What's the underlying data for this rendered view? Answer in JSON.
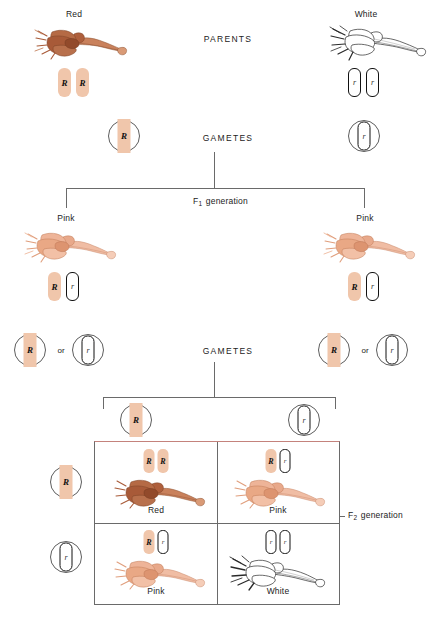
{
  "diagram": {
    "colors": {
      "dominant_allele_block": "#f0c6ab",
      "recessive_allele_block": "#ffffff",
      "line": "#6a6a6a",
      "red_flower": "#b5643f",
      "pink_flower": "#e2a184",
      "white_flower": "#ffffff",
      "punnett_top_border": "#c4827c"
    }
  },
  "stage_labels": {
    "parents": "PARENTS",
    "gametes_1": "GAMETES",
    "gametes_2": "GAMETES",
    "f1_generation_prefix": "F",
    "f1_generation_sub": "1",
    "f1_generation_suffix": " generation",
    "f2_generation_prefix": "F",
    "f2_generation_sub": "2",
    "f2_generation_suffix": " generation"
  },
  "parents": {
    "left": {
      "phenotype": "Red",
      "alleles": [
        "R",
        "R"
      ],
      "allele_types": [
        "dominant",
        "dominant"
      ],
      "flower_color": "red"
    },
    "right": {
      "phenotype": "White",
      "alleles": [
        "r",
        "r"
      ],
      "allele_types": [
        "recessive",
        "recessive"
      ],
      "flower_color": "white"
    }
  },
  "parent_gametes": {
    "left": {
      "allele": "R",
      "type": "dominant"
    },
    "right": {
      "allele": "r",
      "type": "recessive"
    }
  },
  "f1": {
    "left": {
      "phenotype": "Pink",
      "alleles": [
        "R",
        "r"
      ],
      "allele_types": [
        "dominant",
        "recessive"
      ],
      "flower_color": "pink"
    },
    "right": {
      "phenotype": "Pink",
      "alleles": [
        "R",
        "r"
      ],
      "allele_types": [
        "dominant",
        "recessive"
      ],
      "flower_color": "pink"
    }
  },
  "f1_gametes": {
    "left": {
      "option_a": {
        "allele": "R",
        "type": "dominant"
      },
      "conjunction": "or",
      "option_b": {
        "allele": "r",
        "type": "recessive"
      }
    },
    "right": {
      "option_a": {
        "allele": "R",
        "type": "dominant"
      },
      "conjunction": "or",
      "option_b": {
        "allele": "r",
        "type": "recessive"
      }
    }
  },
  "punnett": {
    "column_gametes": [
      {
        "allele": "R",
        "type": "dominant"
      },
      {
        "allele": "r",
        "type": "recessive"
      }
    ],
    "row_gametes": [
      {
        "allele": "R",
        "type": "dominant"
      },
      {
        "allele": "r",
        "type": "recessive"
      }
    ],
    "cells": [
      {
        "position": "top-left",
        "alleles": [
          "R",
          "R"
        ],
        "allele_types": [
          "dominant",
          "dominant"
        ],
        "phenotype": "Red",
        "flower_color": "red"
      },
      {
        "position": "top-right",
        "alleles": [
          "R",
          "r"
        ],
        "allele_types": [
          "dominant",
          "recessive"
        ],
        "phenotype": "Pink",
        "flower_color": "pink"
      },
      {
        "position": "bottom-left",
        "alleles": [
          "R",
          "r"
        ],
        "allele_types": [
          "dominant",
          "recessive"
        ],
        "phenotype": "Pink",
        "flower_color": "pink"
      },
      {
        "position": "bottom-right",
        "alleles": [
          "r",
          "r"
        ],
        "allele_types": [
          "recessive",
          "recessive"
        ],
        "phenotype": "White",
        "flower_color": "white"
      }
    ]
  }
}
